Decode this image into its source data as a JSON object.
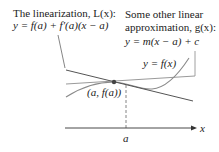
{
  "labels": {
    "linearization_title": "The linearization, L(x):",
    "linearization_eq": "y = f(a) + f′(a)(x − a)",
    "other_title_1": "Some other linear",
    "other_title_2": "approximation, g(x):",
    "other_eq": "y = m(x − a) + c",
    "curve_label": "y = f(x)",
    "point_label": "(a, f(a))",
    "x_axis_label": "x",
    "a_tick_label": "a"
  },
  "colors": {
    "tangent_line": "#555555",
    "other_line": "#9a9a9a",
    "curve": "#8a8a8a",
    "axis": "#333333",
    "point": "#444444",
    "text": "#222222"
  }
}
